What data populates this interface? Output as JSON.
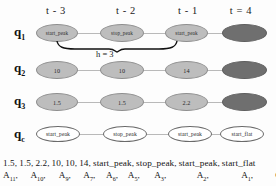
{
  "figure": {
    "columns": [
      {
        "label": "t - 3",
        "x": 35
      },
      {
        "label": "t - 2",
        "x": 105
      },
      {
        "label": "t - 1",
        "x": 170
      },
      {
        "label": "t = 4",
        "x": 226
      }
    ],
    "rows": [
      {
        "id": "q1",
        "label": "q",
        "sub": "1",
        "cells": [
          {
            "text": "start_peak",
            "style": "shaded"
          },
          {
            "text": "stop_peak",
            "style": "shaded"
          },
          {
            "text": "start_peak",
            "style": "shaded"
          },
          {
            "text": "",
            "style": "filled"
          }
        ]
      },
      {
        "id": "q2",
        "label": "q",
        "sub": "2",
        "cells": [
          {
            "text": "10",
            "style": "shaded"
          },
          {
            "text": "10",
            "style": "shaded"
          },
          {
            "text": "14",
            "style": "shaded"
          },
          {
            "text": "",
            "style": "filled"
          }
        ]
      },
      {
        "id": "q3",
        "label": "q",
        "sub": "3",
        "cells": [
          {
            "text": "1.5",
            "style": "shaded"
          },
          {
            "text": "1.5",
            "style": "shaded"
          },
          {
            "text": "2.2",
            "style": "shaded"
          },
          {
            "text": "",
            "style": "filled"
          }
        ]
      },
      {
        "id": "qc",
        "label": "q",
        "sub": "c",
        "cells": [
          {
            "text": "start_peak",
            "style": "hollow"
          },
          {
            "text": "stop_peak",
            "style": "hollow"
          },
          {
            "text": "start_peak",
            "style": "hollow"
          },
          {
            "text": "start_flat",
            "style": "hollow"
          }
        ]
      }
    ],
    "brace": {
      "label": "h = 3"
    },
    "legend": {
      "values": [
        {
          "text": "1.5,",
          "x": 0
        },
        {
          "text": "1.5,",
          "x": 29
        },
        {
          "text": "2.2,",
          "x": 58
        },
        {
          "text": "10,",
          "x": 88
        },
        {
          "text": "10,",
          "x": 112
        },
        {
          "text": "14,",
          "x": 136
        },
        {
          "text": "start_peak,",
          "x": 157
        },
        {
          "text": "stop_peak,",
          "x": 202
        },
        {
          "text": "start_peak,",
          "x": 244
        },
        {
          "text": "start_flat",
          "x": 290
        }
      ],
      "attributes": [
        {
          "name": "A",
          "sub": "11",
          "comma": ",",
          "x": 0
        },
        {
          "name": "A",
          "sub": "10",
          "comma": ",",
          "x": 29
        },
        {
          "name": "A",
          "sub": "9",
          "comma": ",",
          "x": 59
        },
        {
          "name": "A",
          "sub": "7",
          "comma": ",",
          "x": 85
        },
        {
          "name": "A",
          "sub": "6",
          "comma": ",",
          "x": 109
        },
        {
          "name": "A",
          "sub": "5",
          "comma": ",",
          "x": 132
        },
        {
          "name": "A",
          "sub": "3",
          "comma": ",",
          "x": 160
        },
        {
          "name": "A",
          "sub": "2",
          "comma": ",",
          "x": 205
        },
        {
          "name": "A",
          "sub": "1",
          "comma": ",",
          "x": 252
        },
        {
          "name": "Class",
          "sub": "",
          "comma": "",
          "x": 288
        }
      ]
    },
    "colors": {
      "shaded_fill": "#bdbdbd",
      "filled_fill": "#6f6f6f",
      "hollow_fill": "#ffffff",
      "connector": "#b9b9b9",
      "text": "#141414"
    }
  }
}
